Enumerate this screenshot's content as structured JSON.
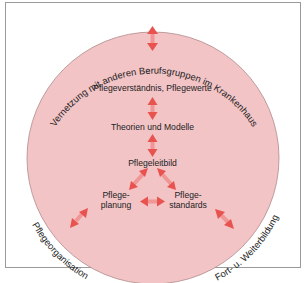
{
  "diagram": {
    "outer_labels": {
      "top": "Vernetzung mit anderen Berufsgruppen  im Krankenhaus",
      "bottom_left": "Pflegeorganisation",
      "bottom_right": "Fort- u. Weiterbildung"
    },
    "nodes": {
      "values": "Pflegeverständnis, Pflegewerte",
      "theories": "Theorien und Modelle",
      "mission": "Pflegeleitbild",
      "planning_line1": "Pflege-",
      "planning_line2": "planung",
      "standards_line1": "Pflege-",
      "standards_line2": "standards"
    },
    "colors": {
      "circle_fill": "#f3c4c6",
      "circle_stroke": "#b08a8c",
      "arrow": "#e8524f",
      "frame": "#9a9a9a"
    }
  }
}
